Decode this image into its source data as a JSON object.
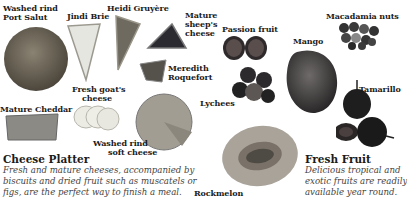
{
  "cheese_section": {
    "title": "Cheese Platter",
    "description_lines": [
      "Fresh and mature cheeses, accompanied by",
      "biscuits and dried fruit such as muscatels or",
      "figs, are the perfect way to finish a meal."
    ],
    "items": {
      "port_salut": [
        "Washed rind",
        "Port Salut"
      ],
      "brie": "Jindi Brie",
      "gruyere": "Heidi Gruyère",
      "sheeps": [
        "Mature",
        "sheep's",
        "cheese"
      ],
      "roquefort": [
        "Meredith",
        "Roquefort"
      ],
      "goats": [
        "Fresh goat's",
        "cheese"
      ],
      "cheddar": "Mature Cheddar",
      "soft": [
        "Washed rind",
        "soft cheese"
      ]
    }
  },
  "fruit_section": {
    "title": "Fresh Fruit",
    "description_lines": [
      "Delicious tropical and",
      "exotic fruits are readily",
      "available year round."
    ],
    "items": {
      "passion": "Passion fruit",
      "macadamia": "Macadamia nuts",
      "mango": "Mango",
      "lychees": "Lychees",
      "tamarillo": "Tamarillo",
      "rockmelon": "Rockmelon"
    }
  }
}
